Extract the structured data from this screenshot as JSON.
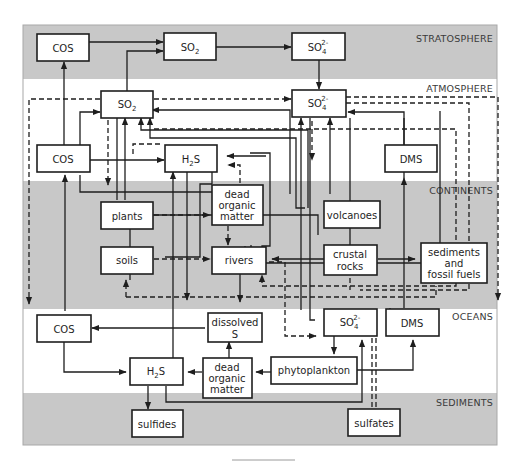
{
  "diagram": {
    "zones": [
      {
        "id": "stratosphere",
        "label": "STRATOSPHERE"
      },
      {
        "id": "atmosphere",
        "label": "ATMOSPHERE"
      },
      {
        "id": "continents",
        "label": "CONTINENTS"
      },
      {
        "id": "oceans",
        "label": "OCEANS"
      },
      {
        "id": "sediments",
        "label": "SEDIMENTS"
      }
    ],
    "nodes": {
      "strat_cos": {
        "label": "COS"
      },
      "strat_so2": {
        "label": "SO",
        "sub": "2"
      },
      "strat_so4": {
        "label": "SO",
        "sub": "4",
        "sup": "2-"
      },
      "atm_so2": {
        "label": "SO",
        "sub": "2"
      },
      "atm_so4": {
        "label": "SO",
        "sub": "4",
        "sup": "2-"
      },
      "atm_cos": {
        "label": "COS"
      },
      "atm_h2s": {
        "label": "H",
        "sub": "2",
        "tail": "S"
      },
      "atm_dms": {
        "label": "DMS"
      },
      "cont_plants": {
        "label": "plants"
      },
      "cont_dom": {
        "lines": [
          "dead",
          "organic",
          "matter"
        ]
      },
      "cont_volcanoes": {
        "label": "volcanoes"
      },
      "cont_soils": {
        "label": "soils"
      },
      "cont_rivers": {
        "label": "rivers"
      },
      "cont_crustal": {
        "lines": [
          "crustal",
          "rocks"
        ]
      },
      "cont_sediments": {
        "lines": [
          "sediments",
          "and",
          "fossil fuels"
        ]
      },
      "ocean_cos": {
        "label": "COS"
      },
      "ocean_dissolved": {
        "lines": [
          "dissolved",
          "S"
        ]
      },
      "ocean_so4": {
        "label": "SO",
        "sub": "4",
        "sup": "2-"
      },
      "ocean_dms": {
        "label": "DMS"
      },
      "ocean_h2s": {
        "label": "H",
        "sub": "2",
        "tail": "S"
      },
      "ocean_dom": {
        "lines": [
          "dead",
          "organic",
          "matter"
        ]
      },
      "ocean_phyto": {
        "label": "phytoplankton"
      },
      "sed_sulfides": {
        "label": "sulfides"
      },
      "sed_sulfates": {
        "label": "sulfates"
      }
    },
    "legend": {
      "solid_line": "flux (solid arrow)",
      "dashed_line": "flux (dashed arrow)"
    },
    "colors": {
      "gray_band": "#c8c8c8",
      "white_band": "#ffffff",
      "stroke": "#1e1e1e"
    }
  }
}
